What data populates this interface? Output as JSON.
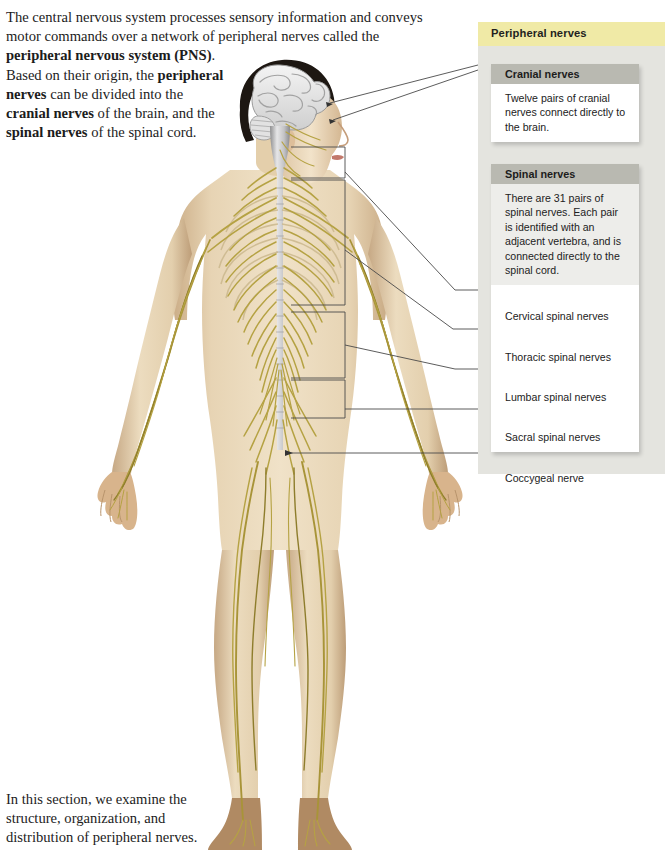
{
  "intro": {
    "line1": "The central nervous system processes sensory information and conveys",
    "line2": "motor commands over a network of peripheral nerves called the",
    "line3_bold": "peripheral nervous system (PNS)",
    "line3_tail": ".",
    "line4_plain": "Based on their origin, the ",
    "line4_bold": "peripheral",
    "line5_bold": "nerves",
    "line5_plain": " can be divided into the",
    "line6_bold": "cranial nerves",
    "line6_plain": " of the brain, and the",
    "line7_bold": "spinal nerves",
    "line7_plain": " of the spinal cord."
  },
  "outro": {
    "line1": "In this section, we examine the",
    "line2": "structure, organization, and",
    "line3": "distribution of peripheral nerves."
  },
  "panel": {
    "band_title": "Peripheral nerves",
    "band_color": "#f0eaa6",
    "backdrop_color": "#e4e4df",
    "header_color": "#b9b9b1",
    "cards": [
      {
        "title": "Cranial nerves",
        "body": "Twelve pairs of cranial nerves connect directly to the brain."
      },
      {
        "title": "Spinal nerves",
        "body": "There are 31 pairs of spinal nerves. Each pair is identified with an adjacent vertebra, and is connected directly to the spinal cord."
      }
    ],
    "nerve_items": [
      "Cervical spinal nerves",
      "Thoracic spinal nerves",
      "Lumbar spinal nerves",
      "Sacral spinal nerves",
      "Coccygeal nerve"
    ]
  },
  "figure": {
    "alt_name": "anterior-view-human-body-peripheral-nervous-system",
    "colors": {
      "skin": "#e8d5b5",
      "skin_shadow": "#c9ab85",
      "nerve": "#b5a243",
      "nerve_dark": "#8e7d2c",
      "brain": "#e9e9e9",
      "brain_line": "#9a9a9a",
      "hair": "#1d1712",
      "cord": "#b9b9ba",
      "leader": "#4a4a4a"
    }
  }
}
